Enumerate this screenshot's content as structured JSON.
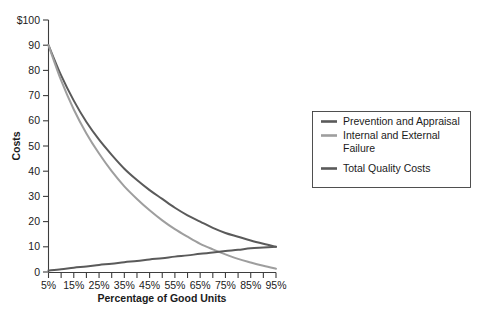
{
  "figure": {
    "background_color": "#ffffff",
    "axis_color": "#3d3d3d",
    "text_color": "#1b1b1b"
  },
  "axes": {
    "y_title": "Costs",
    "x_title": "Percentage of Good Units",
    "y_tick_labels": [
      "$100",
      "90",
      "80",
      "70",
      "60",
      "50",
      "40",
      "30",
      "20",
      "10",
      "0"
    ],
    "x_tick_labels": [
      "5%",
      "15%",
      "25%",
      "35%",
      "45%",
      "55%",
      "65%",
      "75%",
      "85%",
      "95%"
    ]
  },
  "legend": {
    "items": [
      {
        "label": "Prevention and Appraisal",
        "color": "#5a5a5a",
        "swatch_name": "legend-swatch-prevention"
      },
      {
        "label": "Internal and External Failure",
        "color": "#9e9e9e",
        "swatch_name": "legend-swatch-failure"
      },
      {
        "label": "Total Quality Costs",
        "color": "#5a5a5a",
        "swatch_name": "legend-swatch-total"
      }
    ]
  },
  "chart_data": {
    "type": "line",
    "title": "",
    "xlabel": "Percentage of Good Units",
    "ylabel": "Costs",
    "xlim": [
      5,
      95
    ],
    "ylim": [
      0,
      100
    ],
    "grid": false,
    "legend_position": "right",
    "x": [
      5,
      10,
      15,
      20,
      25,
      30,
      35,
      40,
      45,
      50,
      55,
      60,
      65,
      70,
      75,
      80,
      85,
      90,
      95
    ],
    "series": [
      {
        "name": "Prevention and Appraisal",
        "color": "#5a5a5a",
        "values": [
          90,
          78,
          68,
          59.5,
          52.5,
          46.5,
          41,
          36.5,
          32.5,
          29,
          25.5,
          22.5,
          20,
          17.5,
          15.5,
          14,
          12.5,
          11.2,
          10
        ]
      },
      {
        "name": "Internal and External Failure",
        "color": "#9e9e9e",
        "values": [
          90,
          76,
          64.5,
          55,
          47,
          40,
          34,
          29,
          24.5,
          20.5,
          17,
          14,
          11.2,
          9,
          7,
          5.2,
          3.8,
          2.5,
          1.3
        ]
      },
      {
        "name": "Total Quality Costs",
        "color": "#5a5a5a",
        "values": [
          0.6,
          1.1,
          1.7,
          2.2,
          2.8,
          3.3,
          3.9,
          4.4,
          5.0,
          5.5,
          6.1,
          6.6,
          7.2,
          7.7,
          8.3,
          8.8,
          9.4,
          9.7,
          10.0
        ]
      }
    ]
  }
}
